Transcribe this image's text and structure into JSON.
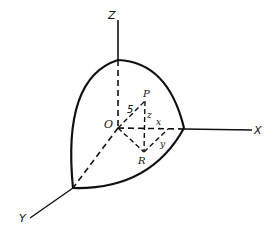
{
  "figure": {
    "axes": {
      "x_label": "X",
      "y_label": "Y",
      "z_label": "Z"
    },
    "points": {
      "origin_label": "O",
      "point_label": "P",
      "projection_label": "R"
    },
    "segment_labels": {
      "radius": "5",
      "z": "z",
      "x": "x",
      "y": "y"
    },
    "colors": {
      "ink": "#111111",
      "background": "#ffffff"
    }
  }
}
